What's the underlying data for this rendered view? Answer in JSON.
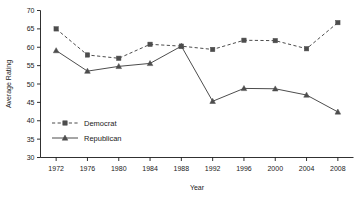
{
  "chart_data": {
    "type": "line",
    "title": "",
    "xlabel": "Year",
    "ylabel": "Average Rating",
    "x": [
      1972,
      1976,
      1980,
      1984,
      1988,
      1992,
      1996,
      2000,
      2004,
      2008
    ],
    "categories": [
      "1972",
      "1976",
      "1980",
      "1984",
      "1988",
      "1992",
      "1996",
      "2000",
      "2004",
      "2008"
    ],
    "series": [
      {
        "name": "Democrat",
        "values": [
          65.0,
          57.9,
          57.0,
          60.8,
          60.3,
          59.4,
          61.9,
          61.8,
          59.6,
          66.7
        ],
        "marker": "square",
        "linestyle": "dashed",
        "color": "#4d4d4d"
      },
      {
        "name": "Republican",
        "values": [
          59.1,
          53.5,
          54.8,
          55.6,
          60.3,
          45.3,
          48.8,
          48.7,
          47.0,
          42.4
        ],
        "marker": "triangle",
        "linestyle": "solid",
        "color": "#4d4d4d"
      }
    ],
    "xlim": [
      1970,
      2010
    ],
    "ylim": [
      30,
      70
    ],
    "yticks": [
      30,
      35,
      40,
      45,
      50,
      55,
      60,
      65,
      70
    ],
    "ytick_labels": [
      "30",
      "35",
      "40",
      "45",
      "50",
      "55",
      "60",
      "65",
      "70"
    ],
    "xticks": [
      1972,
      1976,
      1980,
      1984,
      1988,
      1992,
      1996,
      2000,
      2004,
      2008
    ],
    "grid": false,
    "legend_position": "inside-lower-left",
    "legend_entries": [
      "Democrat",
      "Republican"
    ]
  }
}
